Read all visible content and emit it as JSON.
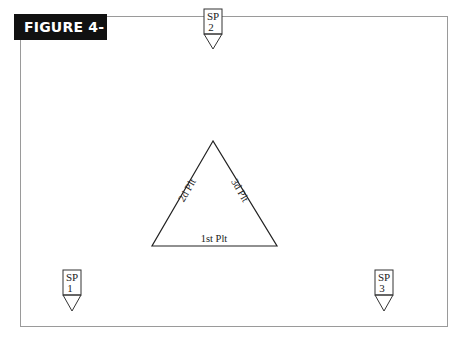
{
  "figure": {
    "label": "FIGURE 4-3"
  },
  "diagram": {
    "triangle": {
      "sides": {
        "bottom": "1st Plt",
        "left": "2d Plt",
        "right": "3d Plt"
      }
    },
    "markers": [
      {
        "id": "sp1",
        "line1": "SP",
        "line2": "1"
      },
      {
        "id": "sp2",
        "line1": "SP",
        "line2": "2"
      },
      {
        "id": "sp3",
        "line1": "SP",
        "line2": "3"
      }
    ]
  },
  "colors": {
    "label_bg": "#111111",
    "label_text": "#ffffff",
    "frame": "#9a9a9a",
    "lines": "#222222"
  }
}
